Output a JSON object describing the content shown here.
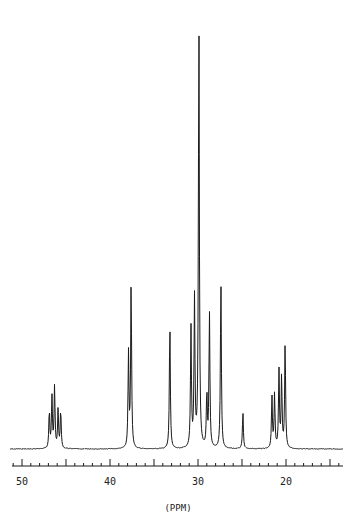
{
  "chart_data": {
    "type": "line",
    "title": "",
    "xlabel": "(PPM)",
    "ylabel": "",
    "xlim": [
      51.2,
      13.6
    ],
    "x_reversed": true,
    "grid": false,
    "legend": null,
    "tick_labels": [
      "50",
      "40",
      "30",
      "20"
    ],
    "major_ticks": [
      50,
      45,
      40,
      35,
      30,
      25,
      20,
      15
    ],
    "minor_tick_step": 1,
    "baseline": 0,
    "peaks": [
      {
        "ppm": 46.9,
        "intensity": 8.8
      },
      {
        "ppm": 46.6,
        "intensity": 12.0
      },
      {
        "ppm": 46.3,
        "intensity": 14.4
      },
      {
        "ppm": 45.9,
        "intensity": 9.0
      },
      {
        "ppm": 45.6,
        "intensity": 9.0
      },
      {
        "ppm": 37.9,
        "intensity": 22.0
      },
      {
        "ppm": 37.6,
        "intensity": 38.5
      },
      {
        "ppm": 33.2,
        "intensity": 29.5
      },
      {
        "ppm": 30.8,
        "intensity": 28.0
      },
      {
        "ppm": 30.4,
        "intensity": 34.6
      },
      {
        "ppm": 29.9,
        "intensity": 100.0
      },
      {
        "ppm": 29.0,
        "intensity": 12.5
      },
      {
        "ppm": 28.7,
        "intensity": 31.5
      },
      {
        "ppm": 27.4,
        "intensity": 39.5
      },
      {
        "ppm": 24.9,
        "intensity": 8.5
      },
      {
        "ppm": 21.6,
        "intensity": 12.0
      },
      {
        "ppm": 21.3,
        "intensity": 12.5
      },
      {
        "ppm": 20.8,
        "intensity": 18.0
      },
      {
        "ppm": 20.5,
        "intensity": 16.5
      },
      {
        "ppm": 20.1,
        "intensity": 24.5
      }
    ]
  },
  "axis": {
    "labels": [
      {
        "text": "50",
        "ppm": 50
      },
      {
        "text": "40",
        "ppm": 40
      },
      {
        "text": "30",
        "ppm": 30
      },
      {
        "text": "20",
        "ppm": 20
      }
    ],
    "unit_label": "(PPM)"
  },
  "colors": {
    "trace": "#1a1a1a",
    "axis": "#1a1a1a",
    "background": "#ffffff"
  }
}
